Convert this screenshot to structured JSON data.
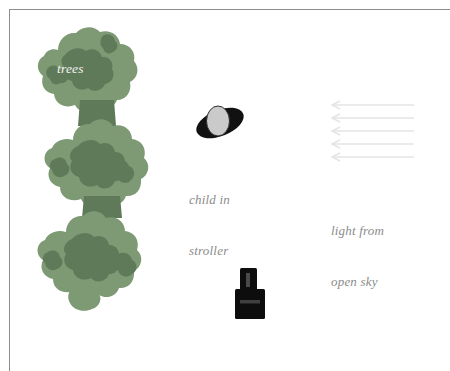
{
  "diagram": {
    "background_color": "#ffffff",
    "frame_color": "#8d8d8d",
    "labels": {
      "trees": "trees",
      "child": "child in\nstroller",
      "child_line1": "child in",
      "child_line2": "stroller",
      "light": "light from\nopen sky",
      "light_line1": "light from",
      "light_line2": "open sky"
    },
    "label_color": "#8b8b8b",
    "trees_label_color": "#f2f2f2",
    "elements": {
      "trees": {
        "name": "trees",
        "fill_light": "#7d9a74",
        "fill_dark": "#5f7a58",
        "count": 3
      },
      "child_in_stroller": {
        "name": "child in stroller",
        "body_color": "#111111",
        "head_color": "#cccccc"
      },
      "camera": {
        "name": "camera",
        "body_color": "#0d0d0d",
        "detail_color": "#4a4a4a"
      },
      "light_rays": {
        "name": "light from open sky",
        "color": "#e4e4e4",
        "direction": "left",
        "count": 5
      }
    }
  }
}
